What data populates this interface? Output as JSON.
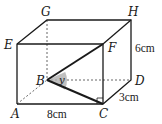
{
  "figure": {
    "type": "cuboid",
    "vertices": {
      "A": {
        "label": "A"
      },
      "B": {
        "label": "B"
      },
      "C": {
        "label": "C"
      },
      "D": {
        "label": "D"
      },
      "E": {
        "label": "E"
      },
      "F": {
        "label": "F"
      },
      "G": {
        "label": "G"
      },
      "H": {
        "label": "H"
      }
    },
    "dimensions": {
      "length": "8cm",
      "width": "3cm",
      "height": "6cm"
    },
    "angle_label": "y",
    "colors": {
      "line": "#1a1a1a",
      "hidden_line": "#555555",
      "angle_fill": "#b0b0b0"
    }
  }
}
